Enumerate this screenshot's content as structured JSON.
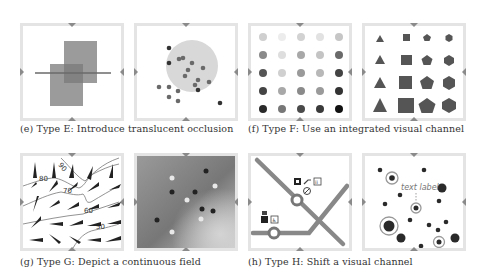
{
  "figure": {
    "subfigures": [
      {
        "id": "e",
        "caption": "(e) Type E: Introduce translucent occlusion",
        "panels": [
          "overlapping-translucent-rectangles",
          "scatter-with-translucent-circle"
        ]
      },
      {
        "id": "f",
        "caption": "(f) Type F: Use an integrated visual channel",
        "panels": [
          "luminance-dot-grid",
          "shape-size-grid"
        ]
      },
      {
        "id": "g",
        "caption": "(g) Type G: Depict a continuous field",
        "panels": [
          "wind-arrows-contours",
          "scatter-on-gradient"
        ]
      },
      {
        "id": "h",
        "caption": "(h) Type H: Shift a visual channel",
        "panels": [
          "transit-map-icons",
          "bubble-scatter-text-label"
        ]
      }
    ],
    "contour_labels": [
      "90",
      "80",
      "70",
      "60",
      "50"
    ],
    "text_label": "text label",
    "colors": {
      "panel_border": "#e4e4e4",
      "marker": "#8a8a8a",
      "dark": "#333333",
      "mid": "#6e6e6e",
      "light_circle": "#dcdcdc"
    }
  }
}
